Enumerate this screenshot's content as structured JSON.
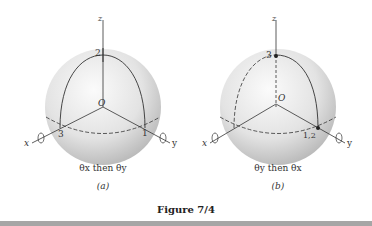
{
  "figure": {
    "title": "Figure 7/4",
    "panels": [
      {
        "id": "a",
        "label": "(a)",
        "caption": "θx then θy",
        "axes": {
          "x": "x",
          "y": "y",
          "z": "z"
        },
        "origin": "O",
        "points": [
          "1",
          "2",
          "3"
        ]
      },
      {
        "id": "b",
        "label": "(b)",
        "caption": "θy then θx",
        "axes": {
          "x": "x",
          "y": "y",
          "z": "z"
        },
        "origin": "O",
        "points": [
          "1,2",
          "3"
        ]
      }
    ]
  },
  "colors": {
    "sphere_light": "#f2f2f2",
    "sphere_dark": "#b8b8b8",
    "line": "#333333",
    "bottom_bar": "#a6a6a6"
  }
}
